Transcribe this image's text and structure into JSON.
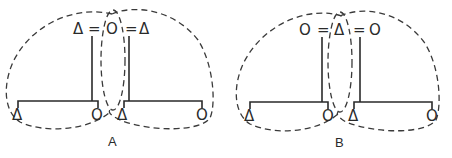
{
  "figure": {
    "diagrams": [
      {
        "label": "A",
        "top_row": [
          "Δ",
          "=",
          "O",
          "=",
          "Δ"
        ],
        "left_children": [
          "Δ",
          "O"
        ],
        "right_children": [
          "Δ",
          "O"
        ]
      },
      {
        "label": "B",
        "top_row": [
          "O",
          "=",
          "Δ",
          "=",
          "O"
        ],
        "left_children": [
          "Δ",
          "O"
        ],
        "right_children": [
          "Δ",
          "O"
        ]
      }
    ],
    "caption_fragment": ""
  }
}
